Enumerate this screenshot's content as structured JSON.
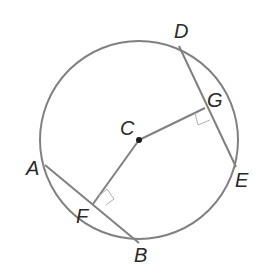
{
  "diagram": {
    "type": "circle-geometry",
    "colors": {
      "stroke": "#808080",
      "label": "#2a2a2a",
      "right_angle_box": "#b0b0b0",
      "center_dot": "#1a1a1a"
    },
    "circle": {
      "center": "C",
      "cx": 139,
      "cy": 140,
      "r": 99
    },
    "points": {
      "A": {
        "x": 45,
        "y": 165
      },
      "B": {
        "x": 139,
        "y": 243
      },
      "C": {
        "x": 139,
        "y": 140
      },
      "D": {
        "x": 179,
        "y": 46
      },
      "E": {
        "x": 236,
        "y": 167
      },
      "F": {
        "x": 93,
        "y": 204
      },
      "G": {
        "x": 205,
        "y": 108
      }
    },
    "segments": [
      "AB",
      "DE",
      "CF",
      "CG"
    ],
    "right_angles": [
      "F",
      "G"
    ],
    "labels": {
      "A": "A",
      "B": "B",
      "C": "C",
      "D": "D",
      "E": "E",
      "F": "F",
      "G": "G"
    }
  }
}
